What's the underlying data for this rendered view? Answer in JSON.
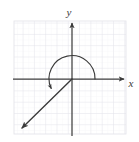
{
  "figure": {
    "type": "coordinate-plane-angle-diagram",
    "background_color": "#ffffff",
    "grid": {
      "color": "#e6e6ec",
      "minor_color": "#f1f1f5",
      "cell_size_px": 11.3,
      "left_px": 14,
      "top_px": 21,
      "right_px": 126,
      "bottom_px": 134,
      "columns": 10,
      "rows": 10,
      "visible": true
    },
    "axes": {
      "color": "#404040",
      "origin_px": {
        "x": 72,
        "y": 79
      },
      "x_axis": {
        "label": "x",
        "label_px": {
          "x": 131,
          "y": 83
        },
        "start_px": {
          "x": 13,
          "y": 79
        },
        "end_px": {
          "x": 127,
          "y": 79
        },
        "arrow_at": "end"
      },
      "y_axis": {
        "label": "y",
        "label_px": {
          "x": 69,
          "y": 13
        },
        "start_px": {
          "x": 72,
          "y": 136
        },
        "end_px": {
          "x": 72,
          "y": 20
        },
        "arrow_at": "end"
      }
    },
    "angle": {
      "initial_side": "positive x-axis",
      "terminal_side_quadrant": "III",
      "direction": "counterclockwise",
      "approx_degrees": 225,
      "arc": {
        "radius_px": 23,
        "start_deg": 0,
        "end_deg": 205,
        "arrow_at": "end",
        "color": "#3a3a3a"
      },
      "terminal_ray": {
        "from_px": {
          "x": 72,
          "y": 79
        },
        "to_px": {
          "x": 18,
          "y": 132
        },
        "arrow_at": "end",
        "color": "#3a3a3a"
      }
    }
  }
}
